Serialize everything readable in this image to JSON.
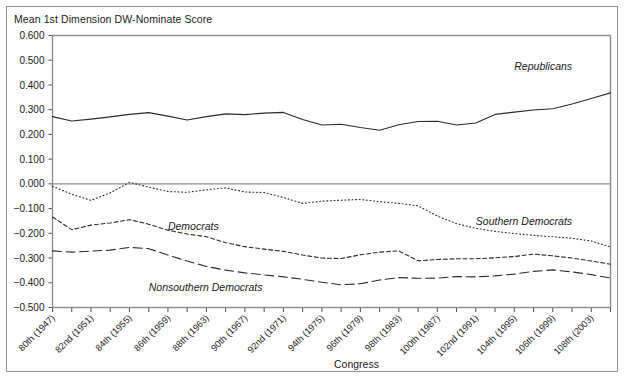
{
  "chart_title": "Mean 1st Dimension DW-Nominate Score",
  "axis": {
    "xlabel": "Congress",
    "ylabel": "",
    "ylim": [
      -0.5,
      0.6
    ],
    "ytick_labels": [
      "0.600",
      "0.500",
      "0.400",
      "0.300",
      "0.200",
      "0.100",
      "0.000",
      "−0.100",
      "−0.200",
      "−0.300",
      "−0.400",
      "−0.500"
    ],
    "ytick_values": [
      0.6,
      0.5,
      0.4,
      0.3,
      0.2,
      0.1,
      0.0,
      -0.1,
      -0.2,
      -0.3,
      -0.4,
      -0.5
    ],
    "xtick_labels": [
      "80th (1947)",
      "82nd (1951)",
      "84th (1955)",
      "86th (1959)",
      "88th (1963)",
      "90th (1967)",
      "92nd (1971)",
      "94th (1975)",
      "96th (1979)",
      "98th (1983)",
      "100th (1987)",
      "102nd (1991)",
      "104th (1995)",
      "106th (1999)",
      "108th (2003)"
    ]
  },
  "series_labels": {
    "republicans": "Republicans",
    "democrats": "Democrats",
    "nonsouthern_democrats": "Nonsouthern Democrats",
    "southern_democrats": "Southern Democrats"
  },
  "colors": {
    "line": "#2b2b2b",
    "frame": "#8d8d8d",
    "text": "#1a1a1a",
    "background": "#ffffff"
  },
  "chart_data": {
    "type": "line",
    "title": "Mean 1st Dimension DW-Nominate Score",
    "xlabel": "Congress",
    "ylabel": "Mean 1st Dimension DW-Nominate Score",
    "ylim": [
      -0.5,
      0.6
    ],
    "grid": false,
    "legend": "inline-annotations",
    "x": [
      "80th (1947)",
      "81st (1949)",
      "82nd (1951)",
      "83rd (1953)",
      "84th (1955)",
      "85th (1957)",
      "86th (1959)",
      "87th (1961)",
      "88th (1963)",
      "89th (1965)",
      "90th (1967)",
      "91st (1969)",
      "92nd (1971)",
      "93rd (1973)",
      "94th (1975)",
      "95th (1977)",
      "96th (1979)",
      "97th (1981)",
      "98th (1983)",
      "99th (1985)",
      "100th (1987)",
      "101st (1989)",
      "102nd (1991)",
      "103rd (1993)",
      "104th (1995)",
      "105th (1997)",
      "106th (1999)",
      "107th (2001)",
      "108th (2003)",
      "109th (2005)"
    ],
    "series": [
      {
        "name": "Republicans",
        "style": "solid",
        "values": [
          0.272,
          0.254,
          0.262,
          0.271,
          0.281,
          0.288,
          0.274,
          0.258,
          0.272,
          0.283,
          0.28,
          0.286,
          0.289,
          0.26,
          0.238,
          0.241,
          0.228,
          0.217,
          0.239,
          0.252,
          0.253,
          0.238,
          0.246,
          0.281,
          0.29,
          0.299,
          0.304,
          0.323,
          0.345,
          0.368
        ]
      },
      {
        "name": "Southern Democrats",
        "style": "dotted",
        "values": [
          -0.01,
          -0.042,
          -0.067,
          -0.036,
          0.006,
          -0.013,
          -0.031,
          -0.034,
          -0.024,
          -0.016,
          -0.033,
          -0.035,
          -0.055,
          -0.079,
          -0.07,
          -0.066,
          -0.063,
          -0.072,
          -0.079,
          -0.089,
          -0.13,
          -0.161,
          -0.18,
          -0.192,
          -0.201,
          -0.208,
          -0.214,
          -0.22,
          -0.231,
          -0.255
        ]
      },
      {
        "name": "Democrats",
        "style": "dashed-short",
        "values": [
          -0.134,
          -0.185,
          -0.167,
          -0.158,
          -0.145,
          -0.163,
          -0.188,
          -0.203,
          -0.214,
          -0.238,
          -0.254,
          -0.264,
          -0.273,
          -0.288,
          -0.3,
          -0.302,
          -0.287,
          -0.276,
          -0.271,
          -0.311,
          -0.306,
          -0.303,
          -0.303,
          -0.299,
          -0.294,
          -0.284,
          -0.291,
          -0.3,
          -0.312,
          -0.325
        ]
      },
      {
        "name": "Nonsouthern Democrats",
        "style": "dashed-long",
        "values": [
          -0.271,
          -0.276,
          -0.272,
          -0.268,
          -0.257,
          -0.262,
          -0.288,
          -0.312,
          -0.334,
          -0.349,
          -0.36,
          -0.368,
          -0.376,
          -0.386,
          -0.398,
          -0.408,
          -0.404,
          -0.389,
          -0.379,
          -0.382,
          -0.381,
          -0.375,
          -0.376,
          -0.372,
          -0.365,
          -0.354,
          -0.348,
          -0.356,
          -0.367,
          -0.381
        ]
      }
    ],
    "annotations": [
      {
        "text": "Republicans",
        "x_index": 24,
        "y": 0.46
      },
      {
        "text": "Southern Democrats",
        "x_index": 22,
        "y": -0.168
      },
      {
        "text": "Democrats",
        "x_index": 6,
        "y": -0.186
      },
      {
        "text": "Nonsouthern Democrats",
        "x_index": 5,
        "y": -0.432
      }
    ]
  }
}
